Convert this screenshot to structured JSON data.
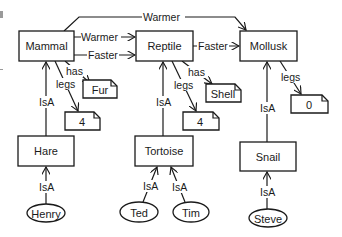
{
  "diagram": {
    "type": "semantic-network",
    "classes": [
      {
        "id": "mammal",
        "label": "Mammal"
      },
      {
        "id": "reptile",
        "label": "Reptile"
      },
      {
        "id": "mollusk",
        "label": "Mollusk"
      },
      {
        "id": "hare",
        "label": "Hare"
      },
      {
        "id": "tortoise",
        "label": "Tortoise"
      },
      {
        "id": "snail",
        "label": "Snail"
      }
    ],
    "values": [
      {
        "id": "fur",
        "label": "Fur"
      },
      {
        "id": "shell",
        "label": "Shell"
      },
      {
        "id": "mammal_legs",
        "label": "4"
      },
      {
        "id": "reptile_legs",
        "label": "4"
      },
      {
        "id": "mollusk_legs",
        "label": "0"
      }
    ],
    "instances": [
      {
        "id": "henry",
        "label": "Henry"
      },
      {
        "id": "ted",
        "label": "Ted"
      },
      {
        "id": "tim",
        "label": "Tim"
      },
      {
        "id": "steve",
        "label": "Steve"
      }
    ],
    "edge_labels": {
      "warmer": "Warmer",
      "faster": "Faster",
      "has": "has",
      "legs": "legs",
      "isa": "IsA"
    },
    "edges": [
      {
        "from": "mammal",
        "to": "mollusk",
        "label": "Warmer"
      },
      {
        "from": "mammal",
        "to": "reptile",
        "label": "Warmer"
      },
      {
        "from": "mammal",
        "to": "reptile",
        "label": "Faster"
      },
      {
        "from": "reptile",
        "to": "mollusk",
        "label": "Faster"
      },
      {
        "from": "mammal",
        "to": "fur",
        "label": "has"
      },
      {
        "from": "mammal",
        "to": "mammal_legs",
        "label": "legs"
      },
      {
        "from": "reptile",
        "to": "shell",
        "label": "has"
      },
      {
        "from": "reptile",
        "to": "reptile_legs",
        "label": "legs"
      },
      {
        "from": "mollusk",
        "to": "mollusk_legs",
        "label": "legs"
      },
      {
        "from": "hare",
        "to": "mammal",
        "label": "IsA"
      },
      {
        "from": "tortoise",
        "to": "reptile",
        "label": "IsA"
      },
      {
        "from": "snail",
        "to": "mollusk",
        "label": "IsA"
      },
      {
        "from": "henry",
        "to": "hare",
        "label": "IsA"
      },
      {
        "from": "ted",
        "to": "tortoise",
        "label": "IsA"
      },
      {
        "from": "tim",
        "to": "tortoise",
        "label": "IsA"
      },
      {
        "from": "steve",
        "to": "snail",
        "label": "IsA"
      }
    ]
  }
}
